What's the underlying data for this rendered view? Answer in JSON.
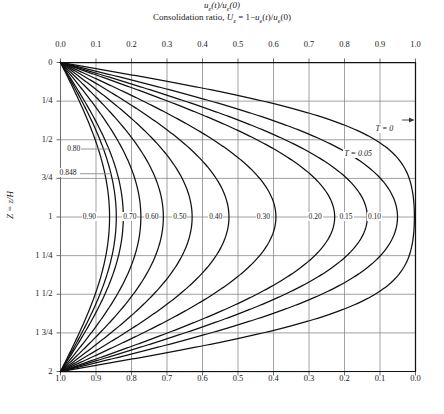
{
  "chart_data": {
    "type": "line",
    "title": "",
    "xlabel_top": "ue(t)/ue(0)",
    "xlabel_bottom": "Consolidation ratio, Uz = 1-ue(t)/ue(0)",
    "ylabel": "Z = z/H",
    "xlim_top": [
      0.0,
      1.0
    ],
    "xlim_bottom": [
      1.0,
      0.0
    ],
    "ylim": [
      0,
      2
    ],
    "grid": true,
    "legend_position": "inline-curve-labels",
    "top_ticks": [
      "0.0",
      "0.1",
      "0.2",
      "0.3",
      "0.4",
      "0.5",
      "0.6",
      "0.7",
      "0.8",
      "0.9",
      "1.0"
    ],
    "bottom_ticks": [
      "1.0",
      "0.9",
      "0.8",
      "0.7",
      "0.6",
      "0.5",
      "0.4",
      "0.3",
      "0.2",
      "0.1",
      "0.0"
    ],
    "y_ticks": [
      "0",
      "1/4",
      "1/2",
      "3/4",
      "1",
      "1 1/4",
      "1 1/2",
      "1 3/4",
      "2"
    ],
    "y_tick_values": [
      0,
      0.25,
      0.5,
      0.75,
      1.0,
      1.25,
      1.5,
      1.75,
      2.0
    ],
    "series": [
      {
        "name": "T = 0",
        "T": 0.0,
        "label": "T = 0",
        "label_x": 0.915,
        "label_y": 0.44
      },
      {
        "name": "T = 0.05",
        "T": 0.05,
        "label": "T = 0.05",
        "label_x": 0.845,
        "label_y": 0.6
      },
      {
        "name": "0.10",
        "T": 0.1,
        "label": "0.10",
        "label_x": 0.885,
        "label_y": 1.0
      },
      {
        "name": "0.15",
        "T": 0.15,
        "label": "0.15",
        "label_x": 0.805,
        "label_y": 1.0
      },
      {
        "name": "0.20",
        "T": 0.2,
        "label": "0.20",
        "label_x": 0.718,
        "label_y": 1.0
      },
      {
        "name": "0.30",
        "T": 0.3,
        "label": "0.30",
        "label_x": 0.572,
        "label_y": 1.0
      },
      {
        "name": "0.40",
        "T": 0.4,
        "label": "0.40",
        "label_x": 0.438,
        "label_y": 1.0
      },
      {
        "name": "0.50",
        "T": 0.5,
        "label": "0.50",
        "label_x": 0.337,
        "label_y": 1.0
      },
      {
        "name": "0.60",
        "T": 0.6,
        "label": "0.60",
        "label_x": 0.258,
        "label_y": 1.0
      },
      {
        "name": "0.70",
        "T": 0.7,
        "label": "0.70",
        "label_x": 0.196,
        "label_y": 1.0
      },
      {
        "name": "0.80",
        "T": 0.8,
        "label": "0.80",
        "label_x": 0.038,
        "label_y": 0.56
      },
      {
        "name": "0.848",
        "T": 0.848,
        "label": "0.848",
        "label_x": 0.022,
        "label_y": 0.72
      },
      {
        "name": "0.90",
        "T": 0.9,
        "label": "0.90",
        "label_x": 0.082,
        "label_y": 1.0
      }
    ]
  },
  "axes": {
    "top_title_parts": {
      "u": "u",
      "e": "e",
      "t": "(t)/",
      "u2": "u",
      "e2": "e",
      "zero": "(0)"
    },
    "bottom_title_parts": {
      "lead": "Consolidation ratio, ",
      "U": "U",
      "z": "z",
      "eq": " = 1−",
      "u": "u",
      "e": "e",
      "t": "(t)/",
      "u2": "u",
      "e2": "e",
      "zero": "(0)"
    },
    "y_title_parts": {
      "Z": "Z",
      "eq": " = ",
      "z": "z",
      "slash": "/",
      "H": "H"
    }
  },
  "colors": {
    "curve": "#111111",
    "grid": "#8a8a8a",
    "frame": "#6e6e6e",
    "text": "#1a1a1a",
    "background": "#ffffff"
  }
}
